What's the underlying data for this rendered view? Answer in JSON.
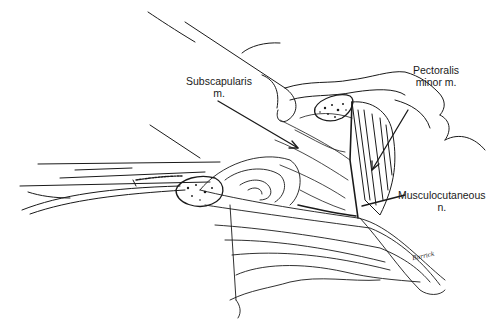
{
  "figure": {
    "type": "anatomical line illustration",
    "background": "#ffffff",
    "ink": "#1a1a1a"
  },
  "labels": [
    {
      "id": "subscapularis",
      "line1": "Subscapularis",
      "line2": "m."
    },
    {
      "id": "pectoralis",
      "line1": "Pectoralis",
      "line2": "minor m."
    },
    {
      "id": "musculocutaneous",
      "line1": "Musculocutaneous",
      "line2": "n."
    }
  ],
  "signature": "Barrick"
}
